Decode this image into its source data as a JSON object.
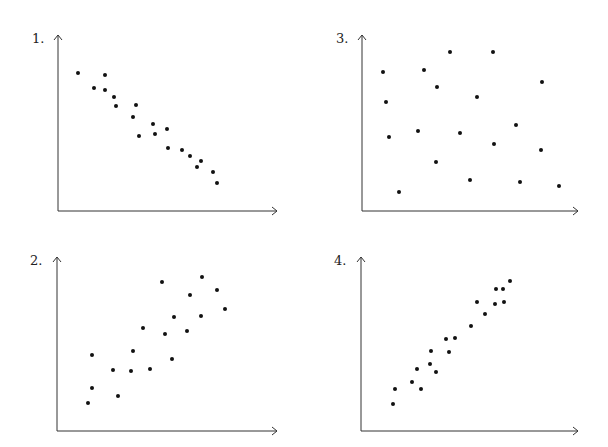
{
  "chart_data": [
    {
      "type": "scatter",
      "label": "1.",
      "title": "",
      "xlabel": "",
      "ylabel": "",
      "grid": false,
      "description": "Strong negative correlation",
      "axis_origin": [
        58,
        211
      ],
      "axis_x_end": 277,
      "axis_y_top": 35,
      "label_pos": [
        32,
        38
      ],
      "points": [
        [
          78,
          73
        ],
        [
          105,
          75
        ],
        [
          94,
          88
        ],
        [
          105,
          90
        ],
        [
          114,
          97
        ],
        [
          116,
          106
        ],
        [
          136,
          105
        ],
        [
          133,
          117
        ],
        [
          153,
          124
        ],
        [
          139,
          136
        ],
        [
          155,
          134
        ],
        [
          167,
          129
        ],
        [
          168,
          148
        ],
        [
          182,
          150
        ],
        [
          190,
          156
        ],
        [
          197,
          167
        ],
        [
          201,
          161
        ],
        [
          213,
          172
        ],
        [
          217,
          183
        ]
      ]
    },
    {
      "type": "scatter",
      "label": "2.",
      "title": "",
      "xlabel": "",
      "ylabel": "",
      "grid": false,
      "description": "Moderate positive correlation",
      "axis_origin": [
        57,
        431
      ],
      "axis_x_end": 277,
      "axis_y_top": 257,
      "label_pos": [
        30,
        260
      ],
      "points": [
        [
          162,
          282
        ],
        [
          202,
          277
        ],
        [
          190,
          295
        ],
        [
          217,
          290
        ],
        [
          225,
          309
        ],
        [
          174,
          317
        ],
        [
          201,
          316
        ],
        [
          143,
          328
        ],
        [
          165,
          334
        ],
        [
          187,
          331
        ],
        [
          133,
          351
        ],
        [
          113,
          370
        ],
        [
          131,
          371
        ],
        [
          150,
          369
        ],
        [
          172,
          359
        ],
        [
          92,
          355
        ],
        [
          92,
          388
        ],
        [
          88,
          403
        ],
        [
          118,
          396
        ]
      ]
    },
    {
      "type": "scatter",
      "label": "3.",
      "title": "",
      "xlabel": "",
      "ylabel": "",
      "grid": false,
      "description": "No correlation",
      "axis_origin": [
        362,
        211
      ],
      "axis_x_end": 578,
      "axis_y_top": 35,
      "label_pos": [
        336,
        38
      ],
      "points": [
        [
          383,
          72
        ],
        [
          424,
          70
        ],
        [
          450,
          52
        ],
        [
          437,
          87
        ],
        [
          493,
          52
        ],
        [
          542,
          82
        ],
        [
          386,
          102
        ],
        [
          477,
          97
        ],
        [
          516,
          125
        ],
        [
          389,
          137
        ],
        [
          418,
          131
        ],
        [
          460,
          133
        ],
        [
          494,
          144
        ],
        [
          541,
          150
        ],
        [
          436,
          162
        ],
        [
          470,
          180
        ],
        [
          520,
          182
        ],
        [
          559,
          186
        ],
        [
          399,
          192
        ]
      ]
    },
    {
      "type": "scatter",
      "label": "4.",
      "title": "",
      "xlabel": "",
      "ylabel": "",
      "grid": false,
      "description": "Strong positive correlation",
      "axis_origin": [
        361,
        431
      ],
      "axis_x_end": 578,
      "axis_y_top": 257,
      "label_pos": [
        334,
        260
      ],
      "points": [
        [
          510,
          281
        ],
        [
          496,
          289
        ],
        [
          503,
          289
        ],
        [
          477,
          302
        ],
        [
          495,
          304
        ],
        [
          504,
          302
        ],
        [
          485,
          314
        ],
        [
          471,
          326
        ],
        [
          446,
          339
        ],
        [
          455,
          338
        ],
        [
          431,
          351
        ],
        [
          449,
          352
        ],
        [
          430,
          364
        ],
        [
          417,
          369
        ],
        [
          436,
          372
        ],
        [
          412,
          382
        ],
        [
          395,
          389
        ],
        [
          421,
          389
        ],
        [
          393,
          404
        ]
      ]
    }
  ],
  "style": {
    "axis_color": "#333333",
    "point_color": "#111111",
    "point_radius": 2
  }
}
